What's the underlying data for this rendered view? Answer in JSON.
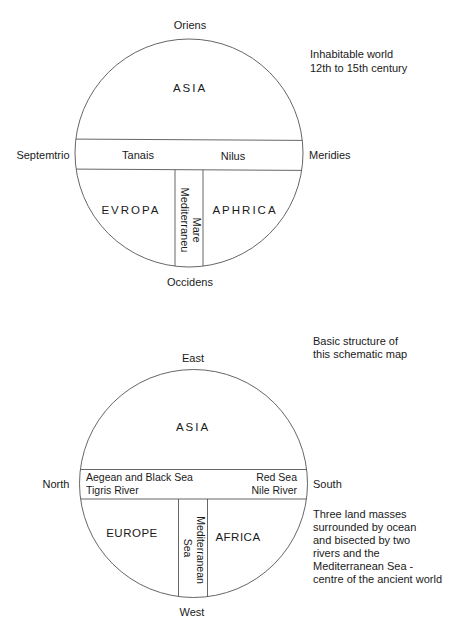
{
  "diagram_1": {
    "title_lines": [
      "Inhabitable world",
      "12th to 15th century"
    ],
    "directions": {
      "top": "Oriens",
      "left": "Septemtrio",
      "right": "Meridies",
      "bottom": "Occidens"
    },
    "regions": {
      "upper": "ASIA",
      "lower_left": "EVROPA",
      "lower_right": "APHRICA"
    },
    "band_labels": {
      "left": "Tanais",
      "right": "Nilus"
    },
    "strip_label_lines": [
      "Mare",
      "Mediterraneu"
    ]
  },
  "diagram_2": {
    "title_lines": [
      "Basic structure of",
      "this schematic map"
    ],
    "directions": {
      "top": "East",
      "left": "North",
      "right": "South",
      "bottom": "West"
    },
    "regions": {
      "upper": "ASIA",
      "lower_left": "EUROPE",
      "lower_right": "AFRICA"
    },
    "band_labels": {
      "left_lines": [
        "Aegean and Black Sea",
        "Tigris River"
      ],
      "right_lines": [
        "Red Sea",
        "Nile River"
      ]
    },
    "strip_label_lines": [
      "Mediterranean",
      "Sea"
    ],
    "description_lines": [
      "Three land masses",
      "surrounded by ocean",
      "and bisected by two",
      "rivers and the",
      "Mediterranean Sea -",
      "centre of the ancient world"
    ]
  },
  "colors": {
    "ink": "#1a1a1a",
    "line": "#555555",
    "background": "#ffffff"
  }
}
